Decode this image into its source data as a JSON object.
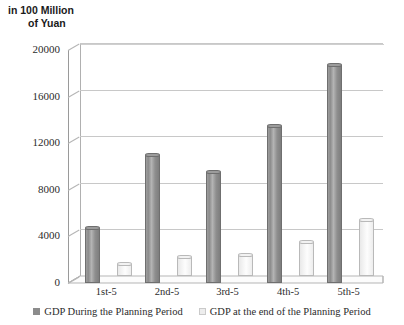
{
  "chart_data": {
    "type": "bar",
    "title": "in 100 Million of Yuan",
    "title_line1": "in 100 Million",
    "title_line2": "of Yuan",
    "xlabel": "",
    "ylabel": "in 100 Million of Yuan",
    "ylim": [
      0,
      20000
    ],
    "yticks": [
      0,
      4000,
      8000,
      12000,
      16000,
      20000
    ],
    "ytick_labels": [
      "0",
      "4000",
      "8000",
      "12000",
      "16000",
      "20000"
    ],
    "grid": true,
    "legend_position": "bottom",
    "three_d": true,
    "categories": [
      "1st-5",
      "2nd-5",
      "3rd-5",
      "4th-5",
      "5th-5"
    ],
    "series": [
      {
        "name": "GDP During the Planning Period",
        "color": "#8c8c8c",
        "values": [
          4700,
          11000,
          9500,
          13500,
          18700
        ]
      },
      {
        "name": "GDP at the end of the Planning Period",
        "color": "#ededed",
        "values": [
          1000,
          1600,
          1800,
          2900,
          4800
        ]
      }
    ]
  },
  "legend": {
    "items": [
      {
        "label": "GDP During the Planning Period",
        "swatch": "dark"
      },
      {
        "label": "GDP at the end of the Planning Period",
        "swatch": "light"
      }
    ]
  }
}
